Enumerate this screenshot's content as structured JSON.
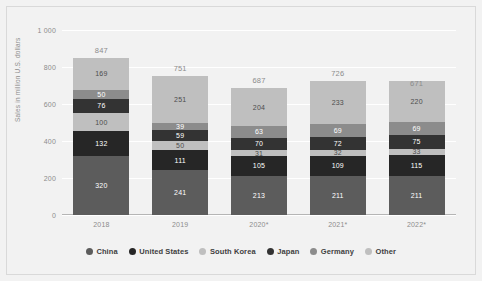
{
  "chart_data": {
    "type": "bar",
    "stacked": true,
    "title": "",
    "xlabel": "",
    "ylabel": "Sales in million U.S. dollars",
    "ylim": [
      0,
      1000
    ],
    "yticks": [
      0,
      200,
      400,
      600,
      800,
      1000
    ],
    "ytick_labels": [
      "0",
      "200",
      "400",
      "600",
      "800",
      "1 000"
    ],
    "grid": true,
    "legend_position": "bottom",
    "categories": [
      "2018",
      "2019",
      "2020*",
      "2021*",
      "2022*"
    ],
    "totals": [
      847,
      751,
      687,
      726,
      671
    ],
    "series": [
      {
        "name": "China",
        "color": "#5c5c5c",
        "values": [
          320,
          241,
          213,
          211,
          211
        ]
      },
      {
        "name": "United States",
        "color": "#262626",
        "values": [
          132,
          111,
          105,
          109,
          115
        ]
      },
      {
        "name": "South Korea",
        "color": "#bfbfbf",
        "values": [
          100,
          50,
          31,
          32,
          33
        ]
      },
      {
        "name": "Japan",
        "color": "#333333",
        "values": [
          76,
          59,
          70,
          72,
          75
        ]
      },
      {
        "name": "Germany",
        "color": "#8c8c8c",
        "values": [
          50,
          39,
          63,
          69,
          69
        ]
      },
      {
        "name": "Other",
        "color": "#bfbfbf",
        "values": [
          169,
          251,
          204,
          233,
          220
        ]
      }
    ]
  },
  "legend": {
    "items": [
      {
        "label": "China",
        "color": "#5c5c5c"
      },
      {
        "label": "United States",
        "color": "#262626"
      },
      {
        "label": "South Korea",
        "color": "#bfbfbf"
      },
      {
        "label": "Japan",
        "color": "#333333"
      },
      {
        "label": "Germany",
        "color": "#8c8c8c"
      },
      {
        "label": "Other",
        "color": "#bfbfbf"
      }
    ]
  },
  "colors": {
    "background": "#f2f2f2",
    "grid": "#ffffff",
    "axis_text": "#8c8c8c",
    "legend_text": "#404040",
    "label_light": "#ffffff",
    "label_dark": "#4d4d4d"
  }
}
